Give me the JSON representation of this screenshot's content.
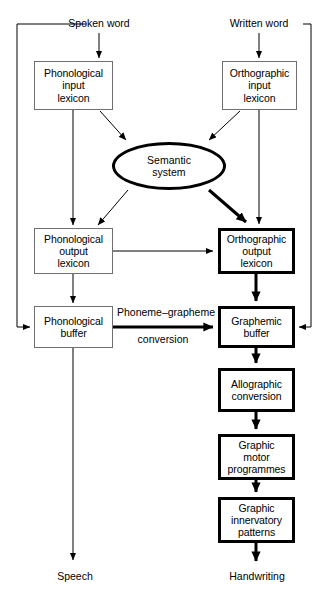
{
  "diagram": {
    "type": "flow-diagram",
    "background": "#ffffff",
    "thin_border_color": "#6f6f6f",
    "thick_border_color": "#000000",
    "text_color": "#000000"
  },
  "inputs": [
    {
      "id": "spoken-word",
      "label": "Spoken word",
      "x": 99,
      "y": 24
    },
    {
      "id": "written-word",
      "label": "Written word",
      "x": 259,
      "y": 24
    }
  ],
  "outputs": [
    {
      "id": "speech",
      "label": "Speech",
      "x": 75,
      "y": 577
    },
    {
      "id": "handwriting",
      "label": "Handwriting",
      "x": 257,
      "y": 577
    }
  ],
  "nodes": [
    {
      "id": "phonological-input-lexicon",
      "label": "Phonological\ninput\nlexicon",
      "shape": "rect",
      "weight": "thin",
      "x": 34,
      "y": 61,
      "w": 79,
      "h": 49
    },
    {
      "id": "orthographic-input-lexicon",
      "label": "Orthographic\ninput\nlexicon",
      "shape": "rect",
      "weight": "thin",
      "x": 222,
      "y": 61,
      "w": 75,
      "h": 49
    },
    {
      "id": "semantic-system",
      "label": "Semantic\nsystem",
      "shape": "ellipse",
      "weight": "thick",
      "x": 112,
      "y": 142,
      "w": 114,
      "h": 48
    },
    {
      "id": "phonological-output-lexicon",
      "label": "Phonological\noutput\nlexicon",
      "shape": "rect",
      "weight": "thin",
      "x": 34,
      "y": 228,
      "w": 79,
      "h": 46
    },
    {
      "id": "orthographic-output-lexicon",
      "label": "Orthographic\noutput\nlexicon",
      "shape": "rect",
      "weight": "thick",
      "x": 218,
      "y": 228,
      "w": 77,
      "h": 46
    },
    {
      "id": "phonological-buffer",
      "label": "Phonological\nbuffer",
      "shape": "rect",
      "weight": "thin",
      "x": 34,
      "y": 306,
      "w": 79,
      "h": 42
    },
    {
      "id": "graphemic-buffer",
      "label": "Graphemic\nbuffer",
      "shape": "rect",
      "weight": "thick",
      "x": 218,
      "y": 306,
      "w": 77,
      "h": 42
    },
    {
      "id": "allographic-conversion",
      "label": "Allographic\nconversion",
      "shape": "rect",
      "weight": "thick",
      "x": 218,
      "y": 368,
      "w": 77,
      "h": 44
    },
    {
      "id": "graphic-motor-programmes",
      "label": "Graphic\nmotor\nprogrammes",
      "shape": "rect",
      "weight": "thick",
      "x": 218,
      "y": 434,
      "w": 77,
      "h": 46
    },
    {
      "id": "graphic-innervatory-patterns",
      "label": "Graphic\ninnervatory\npatterns",
      "shape": "rect",
      "weight": "thick",
      "x": 218,
      "y": 497,
      "w": 77,
      "h": 46
    }
  ],
  "edge_labels": [
    {
      "id": "phoneme-grapheme-conversion-line1",
      "text": "Phoneme–grapheme",
      "x": 166,
      "y": 313
    },
    {
      "id": "phoneme-grapheme-conversion-line2",
      "text": "conversion",
      "x": 163,
      "y": 340
    }
  ],
  "connections": [
    {
      "from": "spoken-word",
      "to": "phonological-input-lexicon",
      "style": "thin-arrow"
    },
    {
      "from": "written-word",
      "to": "orthographic-input-lexicon",
      "style": "thin-arrow"
    },
    {
      "from": "phonological-input-lexicon",
      "to": "semantic-system",
      "style": "thin-arrow-diagonal"
    },
    {
      "from": "orthographic-input-lexicon",
      "to": "semantic-system",
      "style": "thin-arrow-diagonal"
    },
    {
      "from": "phonological-input-lexicon",
      "to": "phonological-output-lexicon",
      "style": "thin-arrow"
    },
    {
      "from": "orthographic-input-lexicon",
      "to": "orthographic-output-lexicon",
      "style": "thin-arrow"
    },
    {
      "from": "semantic-system",
      "to": "phonological-output-lexicon",
      "style": "thin-arrow-diagonal"
    },
    {
      "from": "semantic-system",
      "to": "orthographic-output-lexicon",
      "style": "thick-arrow-diagonal"
    },
    {
      "from": "phonological-output-lexicon",
      "to": "orthographic-output-lexicon",
      "style": "thin-arrow"
    },
    {
      "from": "phonological-output-lexicon",
      "to": "phonological-buffer",
      "style": "thin-arrow"
    },
    {
      "from": "orthographic-output-lexicon",
      "to": "graphemic-buffer",
      "style": "thick-arrow"
    },
    {
      "from": "phonological-buffer",
      "to": "graphemic-buffer",
      "style": "thick-arrow",
      "label": "Phoneme–grapheme conversion"
    },
    {
      "from": "graphemic-buffer",
      "to": "allographic-conversion",
      "style": "thick-arrow"
    },
    {
      "from": "allographic-conversion",
      "to": "graphic-motor-programmes",
      "style": "thick-arrow"
    },
    {
      "from": "graphic-motor-programmes",
      "to": "graphic-innervatory-patterns",
      "style": "thick-arrow"
    },
    {
      "from": "graphic-innervatory-patterns",
      "to": "handwriting",
      "style": "thick-arrow"
    },
    {
      "from": "phonological-buffer",
      "to": "speech",
      "style": "thin-arrow"
    },
    {
      "from": "spoken-word",
      "to": "phonological-buffer",
      "style": "thin-bypass-left"
    },
    {
      "from": "written-word",
      "to": "graphemic-buffer",
      "style": "thin-bypass-right"
    }
  ]
}
